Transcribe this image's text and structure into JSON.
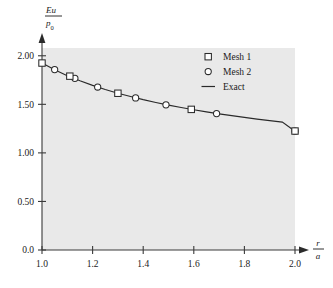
{
  "chart_data": {
    "type": "line",
    "title": "",
    "subtitle": "",
    "xlabel": "r/a",
    "xlabel_num": "r",
    "xlabel_den": "a",
    "ylabel": "Eu/p0",
    "ylabel_num": "Eu",
    "ylabel_den_main": "p",
    "ylabel_den_sub": "0",
    "xlim": [
      1.0,
      2.0
    ],
    "ylim": [
      0.0,
      2.08
    ],
    "xticks": [
      1.0,
      1.2,
      1.4,
      1.6,
      1.8,
      2.0
    ],
    "xticklabels": [
      "1.0",
      "1.2",
      "1.4",
      "1.6",
      "1.8",
      "2.0"
    ],
    "yticks": [
      0.0,
      0.5,
      1.0,
      1.5,
      2.0
    ],
    "yticklabels": [
      "0.0",
      "0.50",
      "1.00",
      "1.50",
      "2.00"
    ],
    "grid": false,
    "legend_position": "top-right",
    "plot_background": "#e9e9e9",
    "line_color": "#2a2a2a",
    "marker_edge_color": "#2b2b2b",
    "marker_face_color": "#ffffff",
    "series": [
      {
        "name": "Exact",
        "style": "line",
        "x": [
          1.0,
          1.05,
          1.1,
          1.15,
          1.2,
          1.25,
          1.3,
          1.35,
          1.4,
          1.45,
          1.5,
          1.55,
          1.6,
          1.65,
          1.7,
          1.75,
          1.8,
          1.85,
          1.9,
          1.95,
          2.0
        ],
        "y": [
          1.925,
          1.855,
          1.795,
          1.742,
          1.695,
          1.652,
          1.614,
          1.58,
          1.548,
          1.519,
          1.492,
          1.467,
          1.444,
          1.422,
          1.402,
          1.383,
          1.365,
          1.348,
          1.332,
          1.317,
          1.222
        ]
      },
      {
        "name": "Mesh 1",
        "style": "square",
        "x": [
          1.0,
          1.11,
          1.3,
          1.59,
          2.0
        ],
        "y": [
          1.925,
          1.79,
          1.614,
          1.448,
          1.225
        ]
      },
      {
        "name": "Mesh 2",
        "style": "circle",
        "x": [
          1.05,
          1.13,
          1.22,
          1.37,
          1.49,
          1.69,
          2.0
        ],
        "y": [
          1.858,
          1.768,
          1.678,
          1.566,
          1.495,
          1.405,
          1.225
        ]
      }
    ],
    "legend": [
      {
        "label": "Mesh 1",
        "marker": "square"
      },
      {
        "label": "Mesh 2",
        "marker": "circle"
      },
      {
        "label": "Exact",
        "marker": "line"
      }
    ]
  }
}
